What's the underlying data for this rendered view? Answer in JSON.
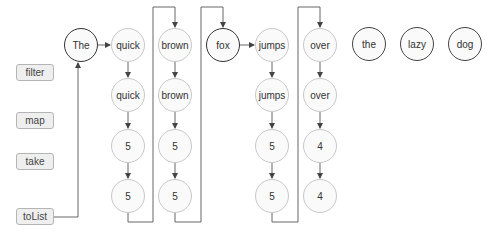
{
  "operations": [
    {
      "label": "filter",
      "top": 64
    },
    {
      "label": "map",
      "top": 112
    },
    {
      "label": "take",
      "top": 153
    },
    {
      "label": "toList",
      "top": 208
    }
  ],
  "source_words": [
    "The",
    "quick",
    "brown",
    "fox",
    "jumps",
    "over",
    "the",
    "lazy",
    "dog"
  ],
  "nodes": {
    "the_src": {
      "label": "The",
      "x": 81,
      "y": 45,
      "style": "src"
    },
    "quick_1": {
      "label": "quick",
      "x": 128,
      "y": 45,
      "style": "proc"
    },
    "quick_2": {
      "label": "quick",
      "x": 128,
      "y": 95,
      "style": "proc"
    },
    "quick_3": {
      "label": "5",
      "x": 128,
      "y": 146,
      "style": "proc"
    },
    "quick_4": {
      "label": "5",
      "x": 128,
      "y": 196,
      "style": "proc"
    },
    "brown_1": {
      "label": "brown",
      "x": 175,
      "y": 45,
      "style": "proc"
    },
    "brown_2": {
      "label": "brown",
      "x": 175,
      "y": 95,
      "style": "proc"
    },
    "brown_3": {
      "label": "5",
      "x": 175,
      "y": 146,
      "style": "proc"
    },
    "brown_4": {
      "label": "5",
      "x": 175,
      "y": 196,
      "style": "proc"
    },
    "fox_src": {
      "label": "fox",
      "x": 223,
      "y": 45,
      "style": "src"
    },
    "jumps_1": {
      "label": "jumps",
      "x": 272,
      "y": 45,
      "style": "proc"
    },
    "jumps_2": {
      "label": "jumps",
      "x": 272,
      "y": 95,
      "style": "proc"
    },
    "jumps_3": {
      "label": "5",
      "x": 272,
      "y": 146,
      "style": "proc"
    },
    "jumps_4": {
      "label": "5",
      "x": 272,
      "y": 196,
      "style": "proc"
    },
    "over_1": {
      "label": "over",
      "x": 320,
      "y": 45,
      "style": "proc"
    },
    "over_2": {
      "label": "over",
      "x": 320,
      "y": 95,
      "style": "proc"
    },
    "over_3": {
      "label": "4",
      "x": 320,
      "y": 146,
      "style": "proc"
    },
    "over_4": {
      "label": "4",
      "x": 320,
      "y": 196,
      "style": "proc"
    },
    "the_idle": {
      "label": "the",
      "x": 369,
      "y": 44,
      "style": "idle"
    },
    "lazy_idle": {
      "label": "lazy",
      "x": 417,
      "y": 44,
      "style": "idle"
    },
    "dog_idle": {
      "label": "dog",
      "x": 465,
      "y": 44,
      "style": "idle"
    }
  },
  "colors": {
    "active_border": "#333333",
    "processed_border": "#c8c8c8",
    "connector": "#555555",
    "label_fill": "#efefef"
  }
}
